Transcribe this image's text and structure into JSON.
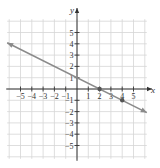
{
  "chart_data": {
    "type": "line",
    "title": "",
    "xlabel": "x",
    "ylabel": "y",
    "xlim": [
      -6,
      6
    ],
    "ylim": [
      -6,
      6
    ],
    "grid": true,
    "x_ticks": [
      -5,
      -4,
      -3,
      -2,
      -1,
      1,
      2,
      3,
      4,
      5
    ],
    "y_ticks": [
      -5,
      -4,
      -3,
      -2,
      -1,
      1,
      2,
      3,
      4,
      5
    ],
    "x_tick_labels": [
      "−5",
      "−4",
      "−3",
      "−2",
      "−1",
      "1",
      "2",
      "3",
      "4",
      "5"
    ],
    "y_tick_labels": [
      "−5",
      "−4",
      "−3",
      "−2",
      "−1",
      "1",
      "2",
      "3",
      "4",
      "5"
    ],
    "series": [
      {
        "name": "y = -x/2 + 1",
        "slope": -0.5,
        "intercept": 1,
        "x": [
          -6,
          6
        ],
        "y": [
          4,
          -2
        ],
        "arrows": "both",
        "color": "#8a8a8a"
      }
    ],
    "points": [
      {
        "x": 2,
        "y": 0
      },
      {
        "x": 4,
        "y": -1
      }
    ]
  },
  "colors": {
    "axis": "#333333",
    "grid": "#d6d6d6",
    "line": "#8a8a8a",
    "point": "#555555"
  }
}
